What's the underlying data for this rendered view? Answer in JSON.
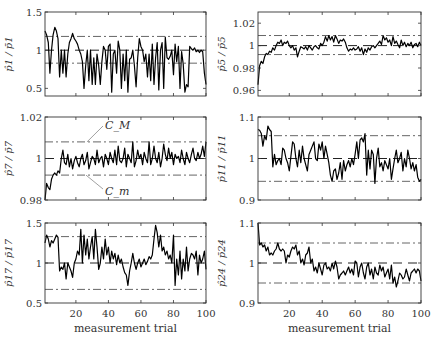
{
  "figure": {
    "xlabel": "measurement trial",
    "xticks": [
      20,
      40,
      60,
      80,
      100
    ],
    "annotations": {
      "upper": "C_M",
      "lower": "C_m"
    }
  },
  "chart_data": [
    {
      "type": "line",
      "id": "p1",
      "ylabel": "p̂1 / p̄1",
      "ylim": [
        0.4,
        1.5
      ],
      "yticks": [
        0.5,
        1,
        1.5
      ],
      "ytick_labels": [
        "0.5",
        "1",
        "1.5"
      ],
      "xlim": [
        1,
        100
      ],
      "ref": 1.0,
      "upper": 1.18,
      "lower": 0.83,
      "values": [
        1.25,
        1.2,
        1.1,
        0.7,
        1.0,
        1.2,
        1.3,
        1.25,
        1.15,
        0.65,
        1.0,
        0.7,
        1.0,
        0.65,
        0.95,
        1.1,
        1.15,
        1.22,
        1.15,
        1.12,
        1.08,
        1.0,
        0.95,
        0.85,
        0.5,
        0.8,
        1.0,
        0.6,
        1.0,
        0.55,
        0.9,
        0.55,
        0.95,
        0.8,
        0.55,
        0.85,
        1.05,
        1.0,
        0.75,
        1.05,
        1.08,
        0.45,
        0.95,
        1.0,
        0.7,
        1.12,
        1.0,
        0.5,
        0.95,
        0.6,
        1.0,
        0.45,
        0.88,
        0.9,
        1.0,
        0.8,
        0.52,
        0.9,
        1.15,
        1.05,
        1.0,
        0.85,
        0.95,
        0.65,
        0.95,
        0.6,
        1.08,
        0.55,
        0.9,
        1.1,
        0.48,
        1.0,
        1.1,
        0.5,
        1.17,
        0.9,
        0.88,
        0.92,
        1.0,
        0.68,
        1.08,
        0.85,
        1.05,
        0.5,
        0.98,
        0.82,
        0.45,
        0.55,
        0.52,
        1.05,
        1.02,
        1.0,
        1.03,
        0.98,
        1.0,
        0.97,
        1.0,
        0.98,
        0.7,
        0.55
      ]
    },
    {
      "type": "line",
      "id": "p5",
      "ylabel": "p̂5 / p̄5",
      "ylim": [
        0.955,
        1.03
      ],
      "yticks": [
        0.96,
        0.98,
        1,
        1.02
      ],
      "ytick_labels": [
        "0.96",
        "0.98",
        "1",
        "1.02"
      ],
      "xlim": [
        1,
        100
      ],
      "ref": 1.0,
      "upper": 1.009,
      "lower": 0.992,
      "values": [
        0.965,
        0.982,
        0.986,
        0.984,
        0.99,
        0.993,
        0.992,
        0.995,
        0.994,
        0.998,
        0.996,
        1.0,
        1.003,
        1.002,
        1.005,
        1.0,
        1.003,
        1.002,
        1.004,
        1.0,
        0.998,
        1.0,
        0.996,
        0.998,
        0.99,
        0.995,
        0.999,
        0.998,
        0.997,
        0.999,
        0.996,
        1.0,
        0.998,
        0.996,
        0.999,
        1.0,
        0.998,
        0.997,
        1.002,
        1.0,
        1.003,
        1.008,
        1.004,
        1.009,
        1.005,
        1.008,
        1.003,
        1.009,
        1.006,
        1.002,
        1.005,
        1.004,
        1.006,
        1.003,
        0.998,
        0.995,
        0.997,
        0.996,
        0.998,
        0.996,
        0.997,
        0.999,
        0.995,
        0.998,
        0.992,
        0.997,
        0.994,
        0.998,
        0.996,
        0.999,
        1.0,
        0.998,
        1.0,
        1.002,
        1.004,
        1.001,
        1.009,
        1.005,
        1.007,
        1.003,
        1.005,
        1.0,
        1.008,
        1.002,
        1.004,
        1.001,
        0.998,
        1.005,
        1.0,
        1.003,
        0.999,
        1.002,
        1.0,
        1.003,
        0.998,
        1.001,
        1.002,
        0.999,
        1.003,
        1.0
      ]
    },
    {
      "type": "line",
      "id": "p7",
      "ylabel": "p̂7 / p̄7",
      "ylim": [
        0.98,
        1.02
      ],
      "yticks": [
        0.98,
        1,
        1.02
      ],
      "ytick_labels": [
        "0.98",
        "1",
        "1.02"
      ],
      "xlim": [
        1,
        100
      ],
      "ref": 1.0,
      "upper": 1.008,
      "lower": 0.992,
      "values": [
        0.98,
        0.988,
        0.986,
        0.985,
        0.99,
        0.992,
        0.993,
        0.992,
        0.994,
        0.993,
        1.0,
        1.004,
        0.998,
        0.997,
        1.002,
        0.996,
        1.0,
        0.995,
        0.999,
        1.001,
        0.998,
        0.996,
        1.0,
        1.002,
        0.997,
        0.999,
        1.003,
        0.995,
        0.998,
        1.001,
        1.0,
        0.997,
        1.004,
        0.998,
        1.0,
        1.001,
        0.996,
        1.002,
        1.0,
        0.997,
        1.003,
        1.0,
        0.998,
        1.004,
        0.997,
        1.006,
        0.999,
        0.998,
        1.0,
        1.005,
        0.996,
        1.002,
        1.0,
        0.998,
        1.008,
        0.996,
        0.999,
        1.004,
        1.0,
        1.002,
        0.997,
        1.003,
        1.0,
        0.998,
        1.008,
        0.997,
        1.0,
        1.006,
        1.0,
        0.998,
        1.003,
        0.996,
        1.0,
        1.007,
        1.002,
        0.999,
        1.005,
        1.0,
        1.003,
        0.997,
        1.002,
        1.0,
        1.001,
        0.998,
        1.004,
        1.0,
        0.997,
        1.003,
        1.0,
        0.998,
        1.002,
        1.005,
        1.0,
        0.999,
        1.003,
        1.0,
        1.002,
        1.006,
        1.001,
        1.008
      ]
    },
    {
      "type": "line",
      "id": "p11",
      "ylabel": "p̂11 / p̄11",
      "ylim": [
        0.9,
        1.1
      ],
      "yticks": [
        0.9,
        1,
        1.1
      ],
      "ytick_labels": [
        "0.9",
        "1",
        "1.1"
      ],
      "xlim": [
        1,
        100
      ],
      "ref": 1.0,
      "upper": 1.055,
      "lower": 0.945,
      "values": [
        1.07,
        1.068,
        1.06,
        1.03,
        1.055,
        1.045,
        1.078,
        1.07,
        1.065,
        0.98,
        1.01,
        0.985,
        0.995,
        1.0,
        0.985,
        1.025,
        1.02,
        1.0,
        0.99,
        0.97,
        1.005,
        1.04,
        1.035,
        1.0,
        0.98,
        1.02,
        0.99,
        1.03,
        1.0,
        0.985,
        0.97,
        1.01,
        1.02,
        1.03,
        1.04,
        1.0,
        0.995,
        1.035,
        1.02,
        1.04,
        1.0,
        1.03,
        1.01,
        0.99,
        0.96,
        0.945,
        0.97,
        0.975,
        0.95,
        0.965,
        0.99,
        0.95,
        0.995,
        0.97,
        0.985,
        0.995,
        0.98,
        1.0,
        0.985,
        1.01,
        1.04,
        1.0,
        1.045,
        1.05,
        1.04,
        1.06,
        0.96,
        1.02,
        0.975,
        1.02,
        1.01,
        0.94,
        1.0,
        1.025,
        0.98,
        0.99,
        0.97,
        0.995,
        0.985,
        0.975,
        1.0,
        0.95,
        0.975,
        1.0,
        1.02,
        0.99,
        1.0,
        1.015,
        0.97,
        1.0,
        0.98,
        1.02,
        1.0,
        0.975,
        0.99,
        0.97,
        0.985,
        0.955,
        0.945,
        0.95
      ]
    },
    {
      "type": "line",
      "id": "p17",
      "ylabel": "p̂17 / p̄17",
      "ylim": [
        0.5,
        1.5
      ],
      "yticks": [
        0.5,
        1,
        1.5
      ],
      "ytick_labels": [
        "0.5",
        "1",
        "1.5"
      ],
      "xlim": [
        1,
        100
      ],
      "ref": 1.0,
      "upper": 1.33,
      "lower": 0.67,
      "values": [
        1.25,
        1.35,
        1.3,
        1.2,
        1.28,
        1.25,
        1.3,
        1.35,
        1.32,
        0.9,
        0.95,
        0.92,
        1.0,
        0.8,
        1.0,
        0.95,
        0.9,
        0.82,
        1.0,
        1.05,
        1.15,
        1.1,
        1.42,
        1.0,
        1.35,
        1.1,
        1.3,
        1.05,
        1.2,
        1.33,
        1.05,
        1.42,
        1.2,
        0.92,
        1.0,
        1.2,
        1.05,
        1.3,
        1.1,
        1.2,
        1.0,
        1.15,
        1.05,
        1.12,
        0.98,
        1.1,
        1.0,
        1.05,
        0.95,
        0.88,
        0.85,
        0.72,
        0.9,
        1.0,
        1.12,
        1.0,
        0.92,
        1.0,
        1.05,
        0.95,
        1.0,
        1.05,
        0.98,
        1.02,
        1.08,
        1.05,
        1.1,
        1.3,
        1.47,
        1.38,
        1.2,
        1.35,
        1.15,
        1.2,
        1.1,
        1.15,
        1.05,
        1.1,
        1.0,
        1.35,
        0.72,
        1.05,
        0.85,
        1.15,
        0.8,
        1.05,
        0.9,
        1.2,
        0.9,
        1.05,
        1.12,
        1.1,
        1.05,
        1.15,
        0.85,
        1.1,
        1.0,
        1.05,
        1.15,
        0.92
      ]
    },
    {
      "type": "line",
      "id": "p24",
      "ylabel": "p̂24 / p̄24",
      "ylim": [
        0.9,
        1.1
      ],
      "yticks": [
        0.9,
        1,
        1.1
      ],
      "ytick_labels": [
        "0.9",
        "1",
        "1.1"
      ],
      "xlim": [
        1,
        100
      ],
      "ref": 1.0,
      "upper": 1.05,
      "lower": 0.95,
      "values": [
        1.1,
        1.045,
        1.05,
        1.04,
        1.045,
        1.03,
        1.04,
        1.02,
        1.025,
        1.02,
        1.03,
        1.035,
        1.05,
        1.035,
        1.03,
        1.035,
        1.03,
        1.0,
        1.02,
        1.015,
        1.03,
        1.04,
        1.035,
        1.045,
        1.02,
        1.03,
        1.0,
        1.01,
        0.995,
        1.02,
        1.025,
        1.04,
        1.0,
        1.01,
        0.98,
        0.99,
        0.975,
        1.0,
        0.985,
        0.97,
        0.995,
        1.0,
        0.985,
        0.99,
        0.98,
        1.0,
        0.985,
        1.005,
        0.99,
        0.96,
        0.97,
        0.975,
        0.98,
        0.97,
        0.98,
        0.99,
        0.975,
        0.985,
        0.97,
        1.005,
        1.0,
        0.965,
        0.99,
        1.0,
        0.975,
        0.96,
        0.99,
        1.0,
        0.97,
        0.985,
        0.96,
        0.99,
        0.975,
        0.97,
        0.995,
        0.98,
        0.99,
        0.965,
        0.975,
        0.985,
        0.96,
        0.995,
        0.95,
        0.965,
        0.94,
        0.955,
        0.975,
        0.97,
        0.96,
        0.965,
        0.985,
        0.97,
        0.955,
        0.975,
        0.98,
        0.985,
        0.975,
        0.985,
        0.98,
        0.955
      ]
    }
  ],
  "layout": {
    "panels": [
      {
        "x0": 45,
        "x1": 206,
        "y0": 12,
        "y1": 96
      },
      {
        "x0": 258,
        "x1": 421,
        "y0": 12,
        "y1": 96
      },
      {
        "x0": 45,
        "x1": 206,
        "y0": 117,
        "y1": 200
      },
      {
        "x0": 258,
        "x1": 421,
        "y0": 117,
        "y1": 200
      },
      {
        "x0": 45,
        "x1": 206,
        "y0": 223,
        "y1": 303
      },
      {
        "x0": 258,
        "x1": 421,
        "y0": 223,
        "y1": 303
      }
    ]
  }
}
